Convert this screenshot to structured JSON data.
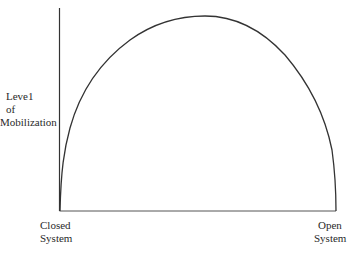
{
  "diagram": {
    "type": "inverted-u curve",
    "y_axis": {
      "label_lines": [
        "Leve1",
        "of",
        "Mobilization"
      ]
    },
    "x_axis": {
      "left_label_lines": [
        "Closed",
        "System"
      ],
      "right_label_lines": [
        "Open",
        "System"
      ]
    },
    "curve": {
      "description": "Level of mobilization rises from closed system to a peak and falls to open system",
      "stroke_color": "#333333"
    },
    "axis_color": "#333333"
  }
}
